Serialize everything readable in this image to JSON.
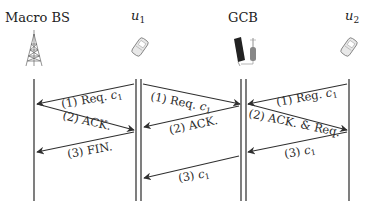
{
  "diagram": {
    "type": "sequence-diagram",
    "colors": {
      "line": "#2f2f2f",
      "text": "#222222",
      "background": "#ffffff"
    },
    "actors": [
      {
        "id": "macro_bs",
        "label": "Macro BS",
        "icon": "cell-tower-icon"
      },
      {
        "id": "u1",
        "label": "u",
        "subscript": "1",
        "icon": "mobile-phone-icon"
      },
      {
        "id": "gcb",
        "label": "GCB",
        "icon": "solar-powered-base-station-icon"
      },
      {
        "id": "u2",
        "label": "u",
        "subscript": "2",
        "icon": "mobile-phone-icon"
      }
    ],
    "panels": [
      {
        "between": [
          "macro_bs",
          "u1"
        ],
        "messages": [
          {
            "step": "(1) Req. ",
            "var": "c",
            "sub": "1",
            "from": "u1",
            "to": "macro_bs"
          },
          {
            "step": "(2) ACK.",
            "var": "",
            "sub": "",
            "from": "macro_bs",
            "to": "u1"
          },
          {
            "step": "(3) FIN.",
            "var": "",
            "sub": "",
            "from": "u1",
            "to": "macro_bs"
          }
        ]
      },
      {
        "between": [
          "u1",
          "gcb"
        ],
        "messages": [
          {
            "step": "(1) Req. ",
            "var": "c",
            "sub": "1",
            "from": "u1",
            "to": "gcb"
          },
          {
            "step": "(2) ACK.",
            "var": "",
            "sub": "",
            "from": "gcb",
            "to": "u1"
          },
          {
            "step": "(3) ",
            "var": "c",
            "sub": "1",
            "from": "gcb",
            "to": "u1"
          }
        ]
      },
      {
        "between": [
          "gcb",
          "u2"
        ],
        "messages": [
          {
            "step": "(1) Reg. ",
            "var": "c",
            "sub": "1",
            "from": "u2",
            "to": "gcb"
          },
          {
            "step": "(2) ACK. & Req.",
            "var": "",
            "sub": "",
            "from": "gcb",
            "to": "u2"
          },
          {
            "step": "(3) ",
            "var": "c",
            "sub": "1",
            "from": "u2",
            "to": "gcb"
          }
        ]
      }
    ]
  }
}
